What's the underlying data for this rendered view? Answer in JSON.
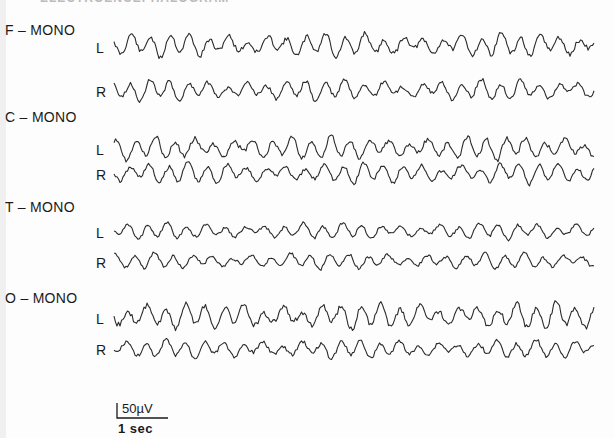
{
  "heading_partial": "ELECTROENCEPHALOGRAM",
  "groups": [
    {
      "label": "F – MONO",
      "y": 22,
      "channels": [
        {
          "label": "L",
          "y": 40,
          "center": 45,
          "seed": 11,
          "amp": 9
        },
        {
          "label": "R",
          "y": 84,
          "center": 90,
          "seed": 23,
          "amp": 8
        }
      ]
    },
    {
      "label": "C – MONO",
      "y": 109,
      "channels": [
        {
          "label": "L",
          "y": 142,
          "center": 148,
          "seed": 37,
          "amp": 9
        },
        {
          "label": "R",
          "y": 167,
          "center": 173,
          "seed": 41,
          "amp": 8
        }
      ]
    },
    {
      "label": "T – MONO",
      "y": 199,
      "channels": [
        {
          "label": "L",
          "y": 225,
          "center": 231,
          "seed": 53,
          "amp": 6
        },
        {
          "label": "R",
          "y": 255,
          "center": 261,
          "seed": 67,
          "amp": 6
        }
      ]
    },
    {
      "label": "O – MONO",
      "y": 290,
      "channels": [
        {
          "label": "L",
          "y": 311,
          "center": 316,
          "seed": 71,
          "amp": 10
        },
        {
          "label": "R",
          "y": 342,
          "center": 349,
          "seed": 83,
          "amp": 7
        }
      ]
    }
  ],
  "calibration": {
    "amplitude": "50µV",
    "time": "1 sec"
  },
  "chart_data": {
    "type": "line",
    "xlabel": "time",
    "ylabel": "µV",
    "legend": [],
    "series": [
      {
        "name": "F-MONO L"
      },
      {
        "name": "F-MONO R"
      },
      {
        "name": "C-MONO L"
      },
      {
        "name": "C-MONO R"
      },
      {
        "name": "T-MONO L"
      },
      {
        "name": "T-MONO R"
      },
      {
        "name": "O-MONO L"
      },
      {
        "name": "O-MONO R"
      }
    ],
    "scale": {
      "amplitude_bar": "50µV",
      "time_bar": "1 sec"
    },
    "x_range_px": [
      114,
      594
    ],
    "grid": false
  }
}
